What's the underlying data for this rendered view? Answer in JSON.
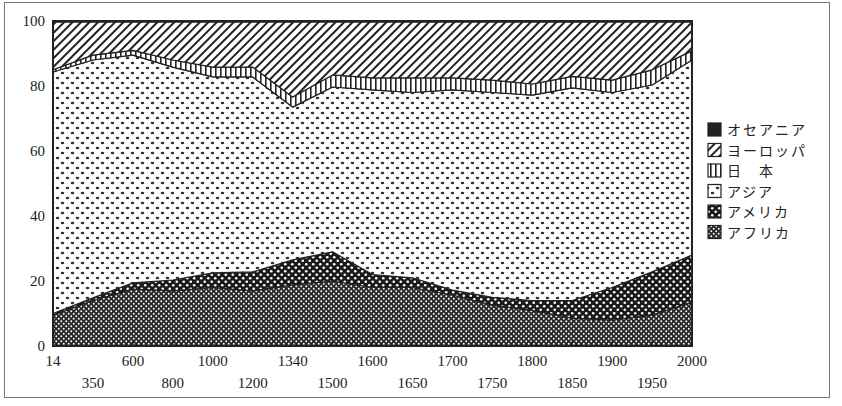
{
  "chart_data": {
    "type": "area",
    "stacked": true,
    "title": "",
    "xlabel": "",
    "ylabel": "",
    "ylim": [
      0,
      100
    ],
    "yticks": [
      0,
      20,
      40,
      60,
      80,
      100
    ],
    "grid": false,
    "legend_position": "right",
    "categories": [
      "14",
      "350",
      "600",
      "800",
      "1000",
      "1200",
      "1340",
      "1500",
      "1600",
      "1650",
      "1700",
      "1750",
      "1800",
      "1850",
      "1900",
      "1950",
      "2000"
    ],
    "series": [
      {
        "name": "アフリカ",
        "pattern": "crosshatch-dense",
        "values": [
          9.5,
          14.0,
          17.5,
          17.0,
          18.0,
          17.0,
          18.8,
          20.0,
          18.0,
          18.0,
          15.7,
          12.6,
          11.0,
          8.6,
          8.0,
          9.5,
          13.5
        ]
      },
      {
        "name": "アメリカ",
        "pattern": "checker-dots",
        "values": [
          0.5,
          0.8,
          1.9,
          3.3,
          4.5,
          5.8,
          7.7,
          9.0,
          4.0,
          3.0,
          1.5,
          2.4,
          3.0,
          5.4,
          10.0,
          13.3,
          14.5
        ]
      },
      {
        "name": "アジア",
        "pattern": "light-dots",
        "values": [
          74.3,
          73.2,
          70.1,
          65.5,
          60.3,
          60.0,
          47.0,
          50.7,
          56.8,
          57.0,
          61.6,
          63.0,
          63.2,
          65.4,
          60.0,
          57.5,
          60.0
        ]
      },
      {
        "name": "日本",
        "pattern": "vertical-lines",
        "values": [
          0.7,
          1.5,
          1.5,
          2.2,
          3.0,
          3.0,
          3.1,
          3.7,
          3.7,
          4.5,
          3.7,
          3.8,
          3.4,
          3.6,
          3.8,
          4.7,
          2.8
        ]
      },
      {
        "name": "ヨーロッパ",
        "pattern": "diagonal-lines",
        "values": [
          14.7,
          10.2,
          8.7,
          11.7,
          13.9,
          13.9,
          23.1,
          16.3,
          17.2,
          17.2,
          17.2,
          17.9,
          19.1,
          16.7,
          17.9,
          14.7,
          8.9
        ]
      },
      {
        "name": "オセアニア",
        "pattern": "solid-black",
        "values": [
          0.3,
          0.3,
          0.3,
          0.3,
          0.3,
          0.3,
          0.3,
          0.3,
          0.3,
          0.3,
          0.3,
          0.3,
          0.3,
          0.3,
          0.3,
          0.3,
          0.3
        ]
      }
    ]
  },
  "legend": {
    "items": [
      {
        "label": "オセアニア",
        "pattern": "solid-black"
      },
      {
        "label": "ヨーロッパ",
        "pattern": "diagonal-lines"
      },
      {
        "label": "日　本",
        "pattern": "vertical-lines"
      },
      {
        "label": "アジア",
        "pattern": "light-dots"
      },
      {
        "label": "アメリカ",
        "pattern": "checker-dots"
      },
      {
        "label": "アフリカ",
        "pattern": "crosshatch-dense"
      }
    ]
  },
  "axes": {
    "y_tick_labels": [
      "0",
      "20",
      "40",
      "60",
      "80",
      "100"
    ],
    "x_tick_labels_upper": [
      "14",
      "600",
      "1000",
      "1340",
      "1600",
      "1700",
      "1800",
      "1900",
      "2000"
    ],
    "x_tick_labels_lower": [
      "350",
      "800",
      "1200",
      "1500",
      "1650",
      "1750",
      "1850",
      "1950"
    ]
  },
  "colors": {
    "ink": "#222222",
    "background": "#ffffff",
    "frame": "#777777"
  }
}
